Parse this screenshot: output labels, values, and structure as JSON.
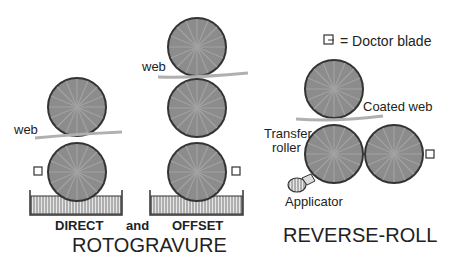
{
  "legend": {
    "symbol": "doctor-blade-icon",
    "text": "= Doctor   blade"
  },
  "rotogravure": {
    "direct": {
      "label": "DIRECT",
      "web_label": "web"
    },
    "and_label": "and",
    "offset": {
      "label": "OFFSET",
      "web_label": "web"
    },
    "title": "ROTOGRAVURE"
  },
  "reverse_roll": {
    "coated_web_label": "Coated web",
    "transfer_roller_label_1": "Transfer",
    "transfer_roller_label_2": "roller",
    "applicator_label": "Applicator",
    "title": "REVERSE-ROLL"
  },
  "colors": {
    "roller": "#8c8c8c",
    "outline": "#333333",
    "web": "#b0b0b0",
    "tray": "#c8c8c8"
  }
}
